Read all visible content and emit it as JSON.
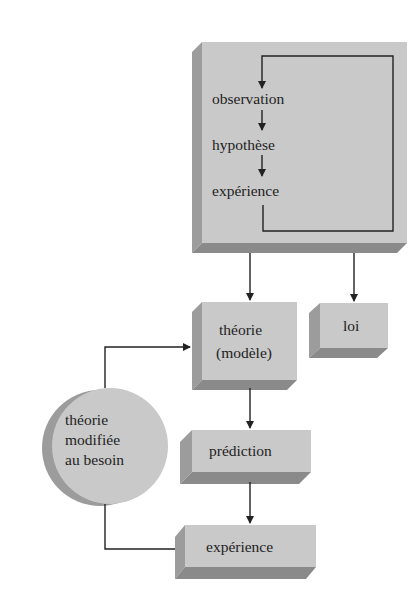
{
  "diagram": {
    "title": "",
    "method_box": {
      "steps": [
        "observation",
        "hypothèse",
        "expérience"
      ]
    },
    "nodes": {
      "theorie": {
        "line1": "théorie",
        "line2": "(modèle)"
      },
      "loi": {
        "label": "loi"
      },
      "prediction": {
        "label": "prédiction"
      },
      "experience": {
        "label": "expérience"
      },
      "theorie_modifiee": {
        "line1": "théorie",
        "line2": "modifiée",
        "line3": "au besoin"
      }
    },
    "colors": {
      "front": "#c9c9c9",
      "side": "#9c9c9c",
      "bottom": "#8a8a8a",
      "line": "#222222",
      "background": "#ffffff"
    },
    "edges": [
      {
        "from": "method_box",
        "to": "theorie"
      },
      {
        "from": "method_box",
        "to": "loi"
      },
      {
        "from": "theorie",
        "to": "prediction"
      },
      {
        "from": "prediction",
        "to": "experience"
      },
      {
        "from": "experience",
        "to": "theorie_modifiee"
      },
      {
        "from": "theorie_modifiee",
        "to": "theorie"
      },
      {
        "from": "experience_step",
        "to": "observation_step",
        "note": "loop"
      }
    ]
  }
}
